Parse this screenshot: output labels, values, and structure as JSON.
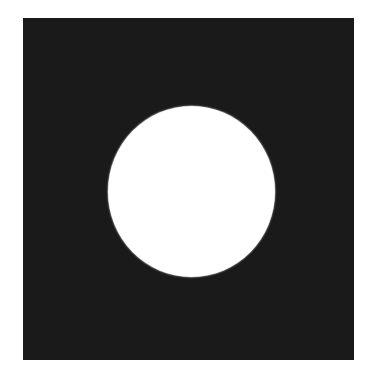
{
  "figure": {
    "background_color": "#ffffff",
    "shapes": [
      {
        "name": "dark-square",
        "type": "rectangle",
        "color": "#1a1a1a",
        "x": 23,
        "y": 18,
        "width": 331,
        "height": 342
      },
      {
        "name": "white-circle",
        "type": "ellipse",
        "color": "#ffffff",
        "center_x": 191.5,
        "center_y": 191.5,
        "width": 167,
        "height": 171
      }
    ]
  }
}
